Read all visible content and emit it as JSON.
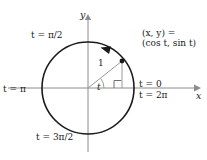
{
  "figure": {
    "axes": {
      "x_label": "x",
      "y_label": "y"
    },
    "labels": {
      "t_zero": "t = 0",
      "t_two_pi": "t = 2π",
      "t_pi": "t = π",
      "t_pi_over_2": "t = π/2",
      "t_three_pi_over_2": "t = 3π/2",
      "point_line1": "(x, y) =",
      "point_line2": "(cos t, sin t)",
      "radius": "1",
      "angle": "t"
    },
    "colors": {
      "stroke": "#1a1a1a",
      "axis": "#8c8c8c",
      "radius_line": "#9a9a9a",
      "background": "#ffffff"
    },
    "geometry": {
      "center_x": 88,
      "center_y": 88,
      "radius_px": 46,
      "point_x": 122,
      "point_y": 61,
      "angle_degrees": 36,
      "direction": "counterclockwise"
    }
  }
}
